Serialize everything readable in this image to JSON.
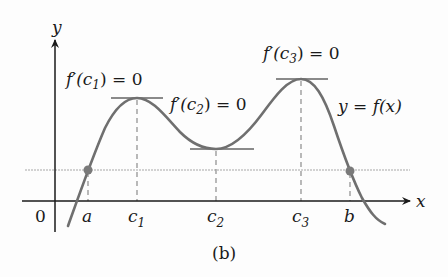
{
  "figure": {
    "caption": "(b)",
    "colors": {
      "curve": "#6f6f6f",
      "axis": "#1a1a1a",
      "tangent": "#8a8a8a",
      "reference_line": "#bdbdbd",
      "dashed_guides": "#8c8c8c",
      "points": "#7a7a7a"
    },
    "axes": {
      "x_label": "x",
      "y_label": "y",
      "origin_label": "0"
    },
    "tick_labels": {
      "a": "a",
      "c1_base": "c",
      "c1_sub": "1",
      "c2_base": "c",
      "c2_sub": "2",
      "c3_base": "c",
      "c3_sub": "3",
      "b": "b"
    },
    "annotations": {
      "c1": {
        "prefix": "f′(c",
        "sub": "1",
        "suffix": ") = 0"
      },
      "c2": {
        "prefix": "f′(c",
        "sub": "2",
        "suffix": ") = 0"
      },
      "c3": {
        "prefix": "f′(c",
        "sub": "3",
        "suffix": ") = 0"
      },
      "curve_label": "y = f(x)"
    },
    "points": [
      {
        "name": "a",
        "x": 88,
        "y": 170
      },
      {
        "name": "b",
        "x": 350,
        "y": 171
      }
    ],
    "critical_points": [
      {
        "name": "c1",
        "kind": "local max",
        "x": 137,
        "y": 98
      },
      {
        "name": "c2",
        "kind": "local min",
        "x": 216,
        "y": 149
      },
      {
        "name": "c3",
        "kind": "local max",
        "x": 301,
        "y": 79
      }
    ]
  }
}
